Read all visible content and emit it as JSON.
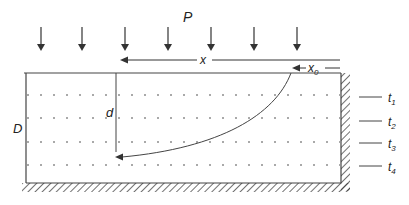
{
  "diagram": {
    "load_label": "P",
    "x_label": "x",
    "x0_label": "x",
    "x0_sub": "0",
    "d_label": "d",
    "D_label": "D",
    "layers": [
      {
        "label": "t",
        "sub": "1"
      },
      {
        "label": "t",
        "sub": "2"
      },
      {
        "label": "t",
        "sub": "3"
      },
      {
        "label": "t",
        "sub": "4"
      }
    ],
    "colors": {
      "line": "#444444",
      "text": "#222222"
    }
  }
}
